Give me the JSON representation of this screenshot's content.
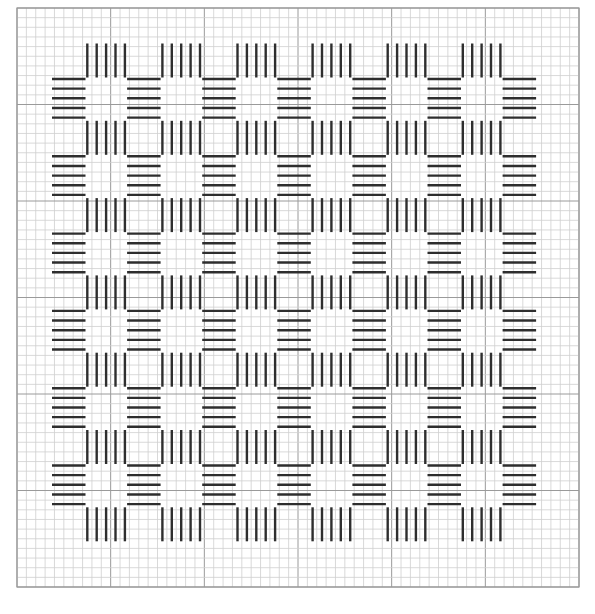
{
  "title": "",
  "chart_type": "needlepoint stitch pattern on grid",
  "grid": {
    "left": 17,
    "top": 8,
    "right": 579,
    "bottom": 587,
    "columns": 60,
    "rows": 60,
    "major_every": 10,
    "minor_color": "#cfcfcf",
    "major_color": "#9a9a9a"
  },
  "stitch_color": "#2e2e2e",
  "vertical_groups": {
    "description": "groups of 5 vertical straight stitches",
    "stitches_per_group": 5,
    "first_x": 87.3,
    "stitch_spacing": 9.4,
    "column_step": 75.1,
    "columns": 6,
    "first_y": 43.5,
    "row_step": 77.3,
    "rows": 7,
    "length": 34
  },
  "horizontal_groups": {
    "description": "groups of 5 horizontal straight stitches",
    "stitches_per_group": 5,
    "first_x": 52,
    "length": 33.5,
    "column_step": 75.1,
    "columns": 7,
    "first_y": 79,
    "stitch_spacing": 9.65,
    "row_step": 77.3,
    "rows": 6
  }
}
